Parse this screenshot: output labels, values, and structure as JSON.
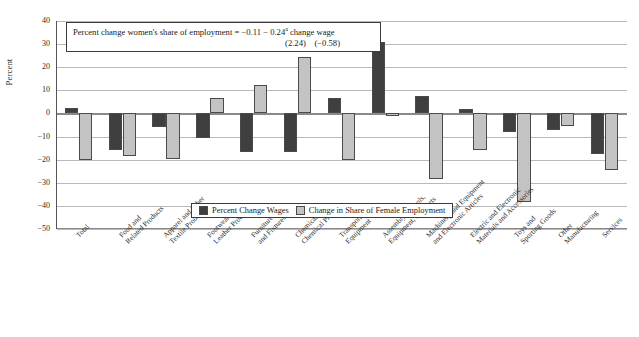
{
  "chart_data": {
    "type": "bar",
    "title": "",
    "xlabel": "",
    "ylabel": "Percent",
    "ylim": [
      -50,
      40
    ],
    "ytick_step": 10,
    "grid": true,
    "legend_position": "inside-bottom-center",
    "categories": [
      "Total",
      "Food and Related Products",
      "Apparel and Other Textile Products",
      "Footwear and Leather Products",
      "Furniture and Fixtures",
      "Chemical and Chemical Products",
      "Transportation Equipment",
      "Assembly of Tools, Equipment, and Parts",
      "Machinery and Equipment and Electronic Articles",
      "Electric and Electronic Materials and Accessories",
      "Toys and Sporting Goods",
      "Other Manufacturing",
      "Services"
    ],
    "category_lines": [
      [
        "Total"
      ],
      [
        "Food and",
        "Related Products"
      ],
      [
        "Apparel and Other",
        "Textile Products"
      ],
      [
        "Footwear and",
        "Leather Products"
      ],
      [
        "Furniture",
        "and Fixtures"
      ],
      [
        "Chemical and",
        "Chemical Products"
      ],
      [
        "Transportation",
        "Equipment"
      ],
      [
        "Assembly of Tools,",
        "Equipment, and Parts"
      ],
      [
        "Machinery and Equipment",
        "and Electronic Articles"
      ],
      [
        "Electric and Electronic",
        "Materials and Accessories"
      ],
      [
        "Toys and",
        "Sporting Goods"
      ],
      [
        "Other",
        "Manufacturing"
      ],
      [
        "Services"
      ]
    ],
    "series": [
      {
        "name": "Percent Change Wages",
        "color": "#3f3f3f",
        "values": [
          2.5,
          -16,
          -6,
          -10.5,
          -16.5,
          -16.5,
          6.5,
          31,
          7.5,
          2,
          -8,
          -7,
          -17.5
        ]
      },
      {
        "name": "Change in Share of Female Employment",
        "color": "#c3c3c3",
        "values": [
          -20,
          -18.5,
          -19.5,
          6.5,
          12.5,
          24.5,
          -20,
          -1,
          -28.5,
          -16,
          -38.5,
          -5.5,
          -24.5
        ]
      }
    ],
    "yticks": [
      40,
      30,
      20,
      10,
      0,
      -10,
      -20,
      -30,
      -40,
      -50
    ]
  },
  "annotation": {
    "line1_prefix": "Percent change women's share of employment = −0.11 − 0.24",
    "line1_superscript": "a",
    "line1_suffix": " change wage",
    "line2": "(2.24) (−0.58)"
  },
  "legend": {
    "items": [
      {
        "label": "Percent Change Wages",
        "swatch": "wages"
      },
      {
        "label": "Change in Share of Female Employment",
        "swatch": "female"
      }
    ]
  }
}
